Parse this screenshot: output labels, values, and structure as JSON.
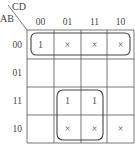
{
  "kmap": {
    "row_var": "AB",
    "col_var": "CD",
    "col_labels": [
      "00",
      "01",
      "11",
      "10"
    ],
    "row_labels": [
      "00",
      "01",
      "11",
      "10"
    ],
    "cells": [
      [
        "1",
        "×",
        "×",
        "×"
      ],
      [
        "",
        "",
        "",
        ""
      ],
      [
        "",
        "1",
        "1",
        ""
      ],
      [
        "",
        "×",
        "×",
        "×"
      ]
    ],
    "groups": [
      {
        "name": "row-00-group",
        "rows": [
          0
        ],
        "cols": [
          0,
          1,
          2,
          3
        ]
      },
      {
        "name": "center-square-group",
        "rows": [
          2,
          3
        ],
        "cols": [
          1,
          2
        ]
      }
    ],
    "colors": {
      "line": "#555555",
      "text": "#444444",
      "background": "#ffffff"
    }
  }
}
